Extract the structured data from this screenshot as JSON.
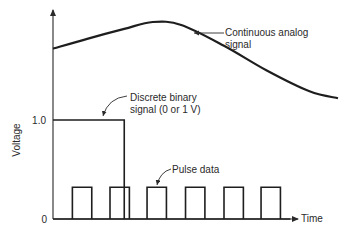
{
  "diagram": {
    "y_axis_label": "Voltage",
    "x_axis_label": "Time",
    "y_ticks": [
      {
        "label": "1.0",
        "value": 1.0
      },
      {
        "label": "0",
        "value": 0
      }
    ],
    "annotations": {
      "analog": [
        "Continuous analog",
        "signal"
      ],
      "binary": [
        "Discrete binary",
        "signal (0 or 1 V)"
      ],
      "pulse": [
        "Pulse data"
      ]
    },
    "signals": {
      "analog": {
        "description": "Continuous analog signal, smooth curve starting above 1.0 V, rising to a peak, then falling",
        "points": [
          [
            0,
            1.72
          ],
          [
            0.12,
            1.82
          ],
          [
            0.25,
            1.92
          ],
          [
            0.35,
            1.99
          ],
          [
            0.45,
            1.96
          ],
          [
            0.6,
            1.75
          ],
          [
            0.75,
            1.5
          ],
          [
            0.9,
            1.29
          ],
          [
            1.0,
            1.22
          ]
        ]
      },
      "binary": {
        "description": "Discrete binary signal at 1 V then dropping to 0",
        "level": 1.0,
        "drop_at": 0.25
      },
      "pulse": {
        "description": "Periodic pulse train",
        "count": 6,
        "level": 0.32,
        "starts": [
          0.068,
          0.2,
          0.33,
          0.465,
          0.6,
          0.73
        ],
        "width": 0.068
      }
    }
  }
}
